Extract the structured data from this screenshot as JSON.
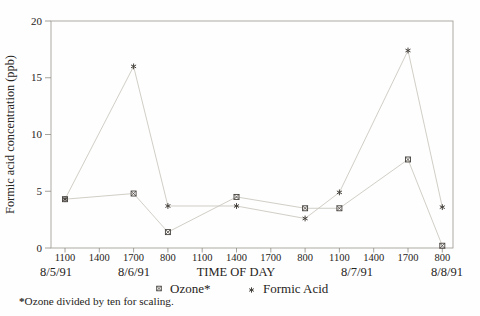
{
  "colors": {
    "background": "#fefefe",
    "frame": "#a6a29a",
    "tick": "#8f8b84",
    "series_line": "#c9c5bc",
    "marker": "#45413c",
    "text": "#262421"
  },
  "chart_data": {
    "type": "line",
    "title": "",
    "ylabel": "Formic acid concentration (ppb)",
    "xlabel": "TIME OF DAY",
    "ylim": [
      0,
      20
    ],
    "y_ticks": [
      0,
      5,
      10,
      15,
      20
    ],
    "x_ticks": [
      "1100",
      "1400",
      "1700",
      "800",
      "1100",
      "1400",
      "1700",
      "800",
      "1100",
      "1400",
      "1700",
      "800"
    ],
    "date_labels": [
      "8/5/91",
      "8/6/91",
      "8/7/91",
      "8/8/91"
    ],
    "grid": false,
    "legend_position": "bottom",
    "series": [
      {
        "name": "Ozone*",
        "marker": "square-x",
        "x_tick_index": [
          0,
          2,
          3,
          5,
          7,
          8,
          10,
          11
        ],
        "values": [
          4.3,
          4.8,
          1.4,
          4.5,
          3.5,
          3.5,
          7.8,
          0.2
        ]
      },
      {
        "name": "Formic Acid",
        "marker": "asterisk",
        "x_tick_index": [
          0,
          2,
          3,
          5,
          7,
          8,
          10,
          11
        ],
        "values": [
          4.3,
          16.0,
          3.7,
          3.7,
          2.6,
          4.9,
          17.4,
          3.6
        ]
      }
    ],
    "footnote_marker": "*",
    "footnote_text": "Ozone divided by ten for scaling."
  }
}
